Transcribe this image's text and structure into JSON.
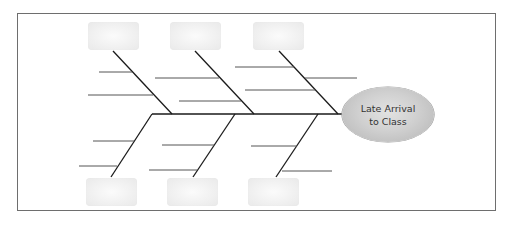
{
  "diagram": {
    "type": "fishbone",
    "effect": {
      "line1": "Late Arrival",
      "line2": "to Class"
    },
    "categories": {
      "top": [
        {
          "label": ""
        },
        {
          "label": ""
        },
        {
          "label": ""
        }
      ],
      "bottom": [
        {
          "label": ""
        },
        {
          "label": ""
        },
        {
          "label": ""
        }
      ]
    },
    "colors": {
      "bone": "#1a1a1a",
      "sub_branch": "#555555",
      "frame": "#6e6e6e",
      "effect_fill": "#c8c8c8",
      "category_box": "#efefef"
    }
  }
}
